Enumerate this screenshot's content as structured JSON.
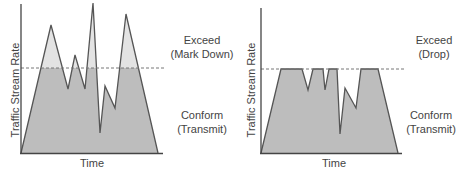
{
  "colors": {
    "conform_fill": "#bdbdbd",
    "exceed_fill": "#e3e3e3",
    "line": "#555555",
    "axis": "#444444",
    "threshold": "#777777",
    "text": "#444444"
  },
  "diagrams": [
    {
      "id": "policing-mark-down",
      "y_axis_label": "Traffic Stream Rate",
      "x_axis_label": "Time",
      "exceed_label": "Exceed",
      "exceed_action": "(Mark Down)",
      "conform_label": "Conform",
      "conform_action": "(Transmit)"
    },
    {
      "id": "policing-drop",
      "y_axis_label": "Traffic Stream Rate",
      "x_axis_label": "Time",
      "exceed_label": "Exceed",
      "exceed_action": "(Drop)",
      "conform_label": "Conform",
      "conform_action": "(Transmit)"
    }
  ]
}
